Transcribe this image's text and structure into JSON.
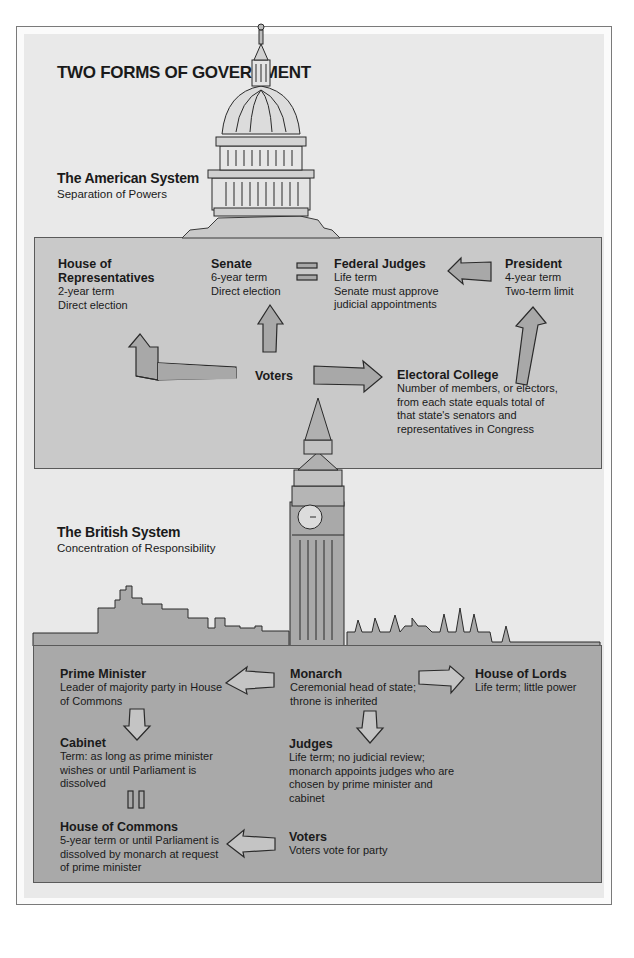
{
  "title": "TWO FORMS OF GOVERNMENT",
  "colors": {
    "page_bg": "#ffffff",
    "panel_bg": "#e9e9e9",
    "american_box": "#c9c9c9",
    "british_box": "#a9a9a9",
    "arrow_fill_us": "#a8a8a8",
    "arrow_fill_uk": "#c4c4c4",
    "outline": "#3a3a3a"
  },
  "american": {
    "title": "The American System",
    "subtitle": "Separation of Powers",
    "illustration": "us-capitol-dome",
    "nodes": {
      "house": {
        "title": "House of Representatives",
        "title_l1": "House of",
        "title_l2": "Representatives",
        "lines": [
          "2-year term",
          "Direct election"
        ]
      },
      "senate": {
        "title": "Senate",
        "lines": [
          "6-year term",
          "Direct election"
        ]
      },
      "judges": {
        "title": "Federal Judges",
        "lines": [
          "Life term",
          "Senate must approve",
          "judicial  appointments"
        ]
      },
      "president": {
        "title": "President",
        "lines": [
          "4-year term",
          "Two-term limit"
        ]
      },
      "voters": {
        "title": "Voters"
      },
      "electoral": {
        "title": "Electoral College",
        "lines": [
          "Number of members, or electors,",
          "from each state equals total of",
          "that state's senators and",
          "representatives in Congress"
        ]
      }
    },
    "connectors": [
      {
        "from": "Voters",
        "to": "House of Representatives",
        "type": "arrow"
      },
      {
        "from": "Voters",
        "to": "Senate",
        "type": "arrow"
      },
      {
        "from": "Voters",
        "to": "Electoral College",
        "type": "arrow"
      },
      {
        "from": "Electoral College",
        "to": "President",
        "type": "arrow"
      },
      {
        "from": "President",
        "to": "Federal Judges",
        "type": "arrow"
      },
      {
        "from": "Senate",
        "to": "Federal Judges",
        "type": "equals"
      }
    ]
  },
  "british": {
    "title": "The British System",
    "subtitle": "Concentration of Responsibility",
    "illustration": "big-ben-westminster-skyline",
    "nodes": {
      "pm": {
        "title": "Prime Minister",
        "lines": [
          "Leader of majority party in House",
          "of Commons"
        ]
      },
      "monarch": {
        "title": "Monarch",
        "lines": [
          "Ceremonial head of state;",
          "throne  is inherited"
        ]
      },
      "lords": {
        "title": "House of Lords",
        "lines": [
          "Life term; little power"
        ]
      },
      "cabinet": {
        "title": "Cabinet",
        "lines": [
          "Term: as long as prime minister",
          "wishes or until Parliament is",
          "dissolved"
        ]
      },
      "judges": {
        "title": "Judges",
        "lines": [
          "Life term; no judicial review;",
          "monarch appoints judges who are",
          "chosen by prime minister and",
          "cabinet"
        ]
      },
      "commons": {
        "title": "House of Commons",
        "lines": [
          "5-year term or until Parliament is",
          "dissolved by monarch at request",
          "of prime minister"
        ]
      },
      "voters": {
        "title": "Voters",
        "lines": [
          "Voters vote for party"
        ]
      }
    },
    "connectors": [
      {
        "from": "Monarch",
        "to": "Prime Minister",
        "type": "arrow"
      },
      {
        "from": "Monarch",
        "to": "House of Lords",
        "type": "arrow"
      },
      {
        "from": "Monarch",
        "to": "Judges",
        "type": "arrow"
      },
      {
        "from": "Prime Minister",
        "to": "Cabinet",
        "type": "arrow"
      },
      {
        "from": "Cabinet",
        "to": "House of Commons",
        "type": "parallel"
      },
      {
        "from": "Voters",
        "to": "House of Commons",
        "type": "arrow"
      }
    ]
  }
}
